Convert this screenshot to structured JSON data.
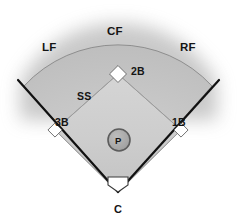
{
  "diagram": {
    "type": "baseball-field-schematic",
    "colors": {
      "outfield_fill": "#c4c4c4",
      "infield_fill": "#cfcfcf",
      "foul_line": "#111111",
      "base_fill": "#ffffff",
      "mound_fill": "#a8a8a8",
      "mound_stroke": "#4a4a4a",
      "label_color": "#141414",
      "background": "#ffffff",
      "halo": "#9a9a9a"
    },
    "positions": [
      {
        "id": "cf",
        "abbr": "CF",
        "name": "Center Field",
        "region": "outfield"
      },
      {
        "id": "lf",
        "abbr": "LF",
        "name": "Left Field",
        "region": "outfield"
      },
      {
        "id": "rf",
        "abbr": "RF",
        "name": "Right Field",
        "region": "outfield"
      },
      {
        "id": "2b",
        "abbr": "2B",
        "name": "Second Base",
        "region": "infield"
      },
      {
        "id": "ss",
        "abbr": "SS",
        "name": "Shortstop",
        "region": "infield"
      },
      {
        "id": "3b",
        "abbr": "3B",
        "name": "Third Base",
        "region": "infield"
      },
      {
        "id": "1b",
        "abbr": "1B",
        "name": "First Base",
        "region": "infield"
      },
      {
        "id": "p",
        "abbr": "P",
        "name": "Pitcher",
        "region": "mound"
      },
      {
        "id": "c",
        "abbr": "C",
        "name": "Catcher",
        "region": "home-plate"
      }
    ],
    "labels": {
      "cf": "CF",
      "lf": "LF",
      "rf": "RF",
      "second_base": "2B",
      "shortstop": "SS",
      "third_base": "3B",
      "first_base": "1B",
      "pitcher": "P",
      "catcher": "C"
    }
  }
}
